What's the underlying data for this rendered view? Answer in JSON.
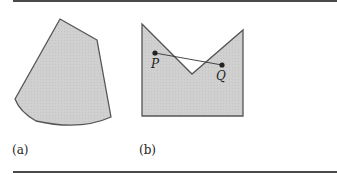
{
  "figure": {
    "panels": [
      {
        "id": "a",
        "caption": "(a)",
        "shape": "convex-region"
      },
      {
        "id": "b",
        "caption": "(b)",
        "shape": "non-convex-region",
        "points": [
          {
            "label": "P"
          },
          {
            "label": "Q"
          }
        ]
      }
    ]
  },
  "colors": {
    "fill": "#cfcfcf",
    "stroke": "#555555",
    "rule": "#4a4a4a"
  }
}
